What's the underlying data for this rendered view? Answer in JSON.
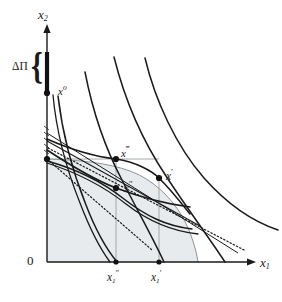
{
  "figure": {
    "kind": "economics-diagram",
    "background_color": "#ffffff",
    "ink_color": "#1a1a1a",
    "shaded_region_color": "#e7ebed",
    "shaded_region_border": "#8b9296"
  },
  "axes": {
    "x_axis": {
      "label_main": "x",
      "label_sub": "1",
      "name": "x-axis-label"
    },
    "y_axis": {
      "label_main": "x",
      "label_sub": "2",
      "name": "y-axis-label"
    },
    "origin_label": "0"
  },
  "annotations": {
    "profit_bracket": {
      "label": "ΔΠ",
      "description": "brace spanning a thick segment on the vertical axis"
    },
    "brace_glyph": "{"
  },
  "points": [
    {
      "id": "x0",
      "label_main": "x",
      "label_sup": "o",
      "cx": 47,
      "cy": 93,
      "name": "point-x-nought"
    },
    {
      "id": "x3",
      "label_main": "x",
      "label_sup": "‴",
      "cx": 116,
      "cy": 159,
      "name": "point-x-triple-prime"
    },
    {
      "id": "x2",
      "label_main": "x",
      "label_sup": "″",
      "cx": 116,
      "cy": 188,
      "name": "point-x-double-prime"
    },
    {
      "id": "x1",
      "label_main": "x",
      "label_sup": "′",
      "cx": 159,
      "cy": 178,
      "name": "point-x-prime"
    },
    {
      "id": "yint",
      "label_main": "",
      "label_sup": "",
      "cx": 47,
      "cy": 159,
      "name": "point-y-intercept"
    }
  ],
  "ticks": [
    {
      "id": "x1dd",
      "label_main": "x",
      "label_sub": "1",
      "label_sup": "″",
      "x": 116,
      "name": "tick-x1-double-prime"
    },
    {
      "id": "x1d",
      "label_main": "x",
      "label_sub": "1",
      "label_sup": "′",
      "x": 159,
      "name": "tick-x1-prime"
    }
  ],
  "curves": {
    "isoquants_count": 4,
    "isocost_count": 3,
    "dotted_lines_count": 2,
    "note": "convex decreasing curves (isoquants) plus straight isocost lines and dotted tangent rays"
  }
}
